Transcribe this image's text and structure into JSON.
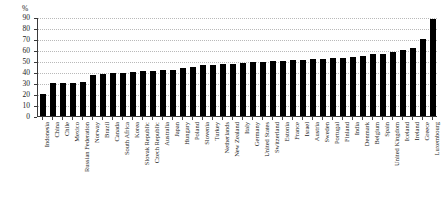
{
  "chart_data": {
    "type": "bar",
    "title": "",
    "xlabel": "",
    "ylabel": "%",
    "unit_label": "%",
    "ylim": [
      0,
      90
    ],
    "ytick_step": 10,
    "yticks": [
      0,
      10,
      20,
      30,
      40,
      50,
      60,
      70,
      80,
      90
    ],
    "ytick_labels": [
      "0",
      "10",
      "20",
      "30",
      "40",
      "50",
      "60",
      "70",
      "80",
      "90"
    ],
    "grid": true,
    "grid_style": "dotted-horizontal",
    "legend": "none",
    "bar_color": "#000000",
    "axis_color": "#3a3a3a",
    "grid_color": "#b9b9b9",
    "categories": [
      "Indonesia",
      "China",
      "Chile",
      "Mexico",
      "Russian Federation",
      "Norway",
      "Brazil",
      "Canada",
      "South Africa",
      "Korea",
      "Slovak Republic",
      "Czech Republic",
      "Australia",
      "Japan",
      "Hungary",
      "Poland",
      "Slovenia",
      "Turkey",
      "Netherlands",
      "New Zealand",
      "Italy",
      "Germany",
      "United States",
      "Switzerland",
      "Estonia",
      "France",
      "Israel",
      "Austria",
      "Sweden",
      "Portugal",
      "Finland",
      "India",
      "Denmark",
      "Belgium",
      "Spain",
      "United Kingdom",
      "Iceland",
      "Ireland",
      "Greece",
      "Luxembourg"
    ],
    "values": [
      20,
      30,
      30,
      30,
      31,
      37,
      38,
      39,
      39,
      40,
      41,
      41,
      42,
      42,
      44,
      45,
      46,
      46,
      47,
      47,
      48,
      49,
      49,
      50,
      50,
      51,
      51,
      52,
      52,
      53,
      53,
      54,
      55,
      56,
      56,
      58,
      60,
      62,
      70,
      88
    ]
  }
}
